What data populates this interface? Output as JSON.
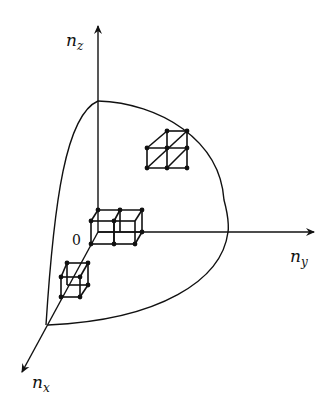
{
  "diagram": {
    "type": "3d-axes-with-octant-surface",
    "axes": {
      "z": {
        "label": "n",
        "sub": "z"
      },
      "y": {
        "label": "n",
        "sub": "y"
      },
      "x": {
        "label": "n",
        "sub": "x"
      }
    },
    "origin_label": "0",
    "elements": [
      "octant of a sphere-like surface bounded by curves",
      "two adjacent unit cubes at origin along n_y",
      "one cube along n_x axis",
      "2x2 lattice with diagonals near surface"
    ],
    "colors": {
      "stroke": "#111111",
      "background": "#ffffff"
    }
  }
}
